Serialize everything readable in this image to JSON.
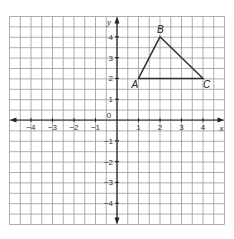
{
  "diagram": {
    "type": "coordinate-grid",
    "x_axis_label": "x",
    "y_axis_label": "y",
    "origin_label": "0",
    "x_range": [
      -5,
      5
    ],
    "y_range": [
      -5,
      5
    ],
    "x_ticks": [
      "-4",
      "-3",
      "-2",
      "-1",
      "1",
      "2",
      "3",
      "4"
    ],
    "y_ticks": [
      "4",
      "3",
      "2",
      "1",
      "-1",
      "-2",
      "-3",
      "-4"
    ],
    "grid_cells_per_unit": 2,
    "triangle": {
      "points": [
        {
          "label": "A",
          "x": 1,
          "y": 2
        },
        {
          "label": "B",
          "x": 2,
          "y": 4
        },
        {
          "label": "C",
          "x": 4,
          "y": 2
        }
      ]
    },
    "colors": {
      "grid": "#9a9a9a",
      "axis": "#222222",
      "triangle": "#333333"
    }
  }
}
